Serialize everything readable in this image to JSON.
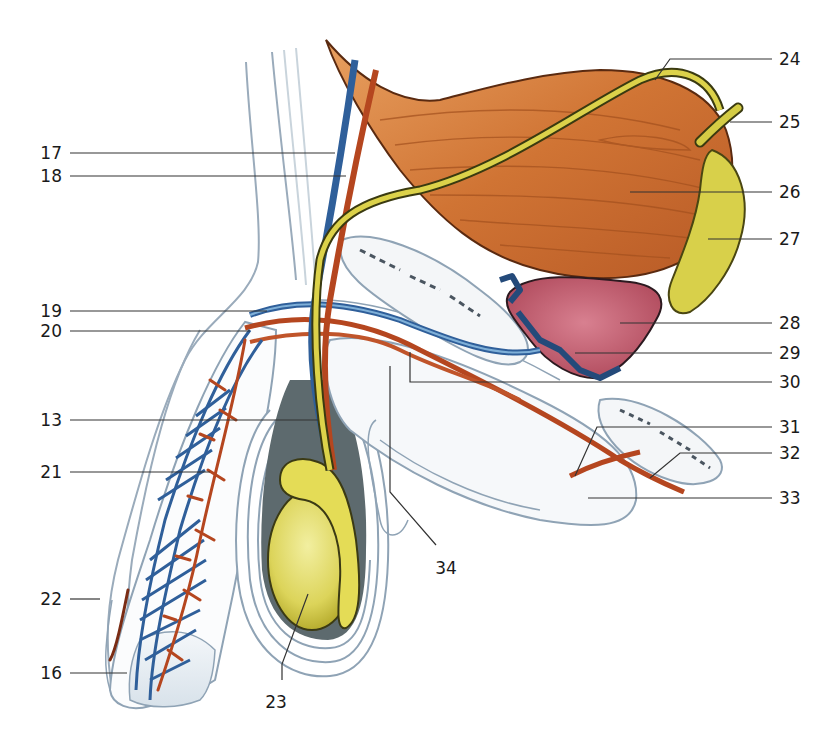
{
  "figure": {
    "type": "anatomical-illustration",
    "view": "sagittal section, male pelvis / genital organs with vessels and ductus deferens",
    "colors": {
      "artery": "#b5461f",
      "vein": "#2f5f9a",
      "ductus": "#d8c83a",
      "bladder_muscle": "#d47a3a",
      "prostate": "#c25a6a",
      "testis": "#e6e070",
      "seminal_vesicle": "#d9d24a",
      "fascia_outline": "#8fa3b5",
      "leader_line": "#333333"
    }
  },
  "labels": {
    "left": [
      {
        "id": "17",
        "text": "17"
      },
      {
        "id": "18",
        "text": "18"
      },
      {
        "id": "19",
        "text": "19"
      },
      {
        "id": "20",
        "text": "20"
      },
      {
        "id": "13",
        "text": "13"
      },
      {
        "id": "21",
        "text": "21"
      },
      {
        "id": "22",
        "text": "22"
      },
      {
        "id": "16",
        "text": "16"
      }
    ],
    "right": [
      {
        "id": "24",
        "text": "24"
      },
      {
        "id": "25",
        "text": "25"
      },
      {
        "id": "26",
        "text": "26"
      },
      {
        "id": "27",
        "text": "27"
      },
      {
        "id": "28",
        "text": "28"
      },
      {
        "id": "29",
        "text": "29"
      },
      {
        "id": "30",
        "text": "30"
      },
      {
        "id": "31",
        "text": "31"
      },
      {
        "id": "32",
        "text": "32"
      },
      {
        "id": "33",
        "text": "33"
      }
    ],
    "bottom": [
      {
        "id": "34",
        "text": "34"
      },
      {
        "id": "23",
        "text": "23"
      }
    ]
  }
}
